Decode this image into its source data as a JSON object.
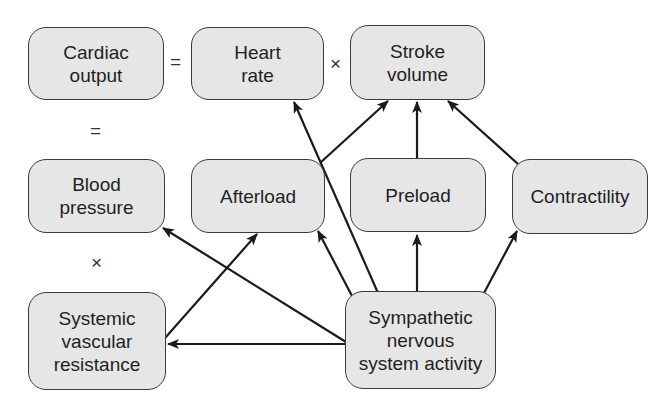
{
  "nodes": {
    "cardiac_output": "Cardiac\noutput",
    "heart_rate": "Heart\nrate",
    "stroke_volume": "Stroke\nvolume",
    "blood_pressure": "Blood\npressure",
    "afterload": "Afterload",
    "preload": "Preload",
    "contractility": "Contractility",
    "svr": "Systemic\nvascular\nresistance",
    "sympathetic": "Sympathetic\nnervous\nsystem activity"
  },
  "operators": {
    "equals_top": "=",
    "times_top": "×",
    "equals_left": "=",
    "times_left": "×"
  },
  "edges": [
    {
      "from": "Afterload",
      "to": "Stroke volume"
    },
    {
      "from": "Preload",
      "to": "Stroke volume"
    },
    {
      "from": "Contractility",
      "to": "Stroke volume"
    },
    {
      "from": "Sympathetic nervous system activity",
      "to": "Heart rate"
    },
    {
      "from": "Sympathetic nervous system activity",
      "to": "Afterload"
    },
    {
      "from": "Sympathetic nervous system activity",
      "to": "Preload"
    },
    {
      "from": "Sympathetic nervous system activity",
      "to": "Contractility"
    },
    {
      "from": "Sympathetic nervous system activity",
      "to": "Blood pressure"
    },
    {
      "from": "Sympathetic nervous system activity",
      "to": "Systemic vascular resistance"
    },
    {
      "from": "Systemic vascular resistance",
      "to": "Afterload"
    }
  ]
}
